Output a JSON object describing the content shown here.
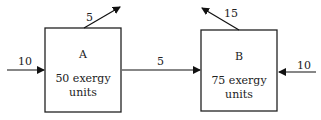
{
  "diagram": {
    "type": "exergy-flow",
    "nodes": [
      {
        "id": "A",
        "label": "A",
        "content": [
          "50 exergy",
          "units"
        ]
      },
      {
        "id": "B",
        "label": "B",
        "content": [
          "75 exergy",
          "units"
        ]
      }
    ],
    "flows": [
      {
        "from": "external",
        "to": "A",
        "value": "10"
      },
      {
        "from": "A",
        "to": "external-up",
        "value": "5"
      },
      {
        "from": "A",
        "to": "B",
        "value": "5"
      },
      {
        "from": "B",
        "to": "external-up",
        "value": "15"
      },
      {
        "from": "external",
        "to": "B",
        "value": "10"
      }
    ]
  },
  "labels": {
    "a_in": "10",
    "a_out_up": "5",
    "a_to_b": "5",
    "b_out_up": "15",
    "b_in": "10"
  },
  "box_a": {
    "title": "A",
    "line1": "50 exergy",
    "line2": "units"
  },
  "box_b": {
    "title": "B",
    "line1": "75 exergy",
    "line2": "units"
  }
}
